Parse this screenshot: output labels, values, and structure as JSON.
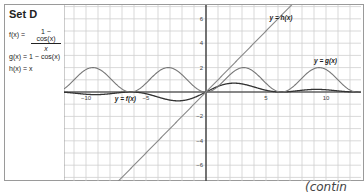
{
  "set_label": "Set D",
  "functions": {
    "f": {
      "lhs": "f(x) =",
      "numerator": "1 − cos(x)",
      "denominator": "x"
    },
    "g": {
      "text": "g(x) = 1 − cos(x)"
    },
    "h": {
      "text": "h(x) = x"
    }
  },
  "continued_label": "(contin",
  "chart_data": {
    "type": "line",
    "title": "Set D",
    "xlabel": "",
    "ylabel": "",
    "xlim": [
      -11.8,
      12.9
    ],
    "ylim": [
      -7.2,
      7.2
    ],
    "grid": true,
    "x_ticks": [
      -10,
      -5,
      5,
      10
    ],
    "y_ticks": [
      -6,
      -4,
      -2,
      2,
      4,
      6
    ],
    "x_tick_labels": [
      "−10",
      "−5",
      "5",
      "10"
    ],
    "y_tick_labels": [
      "−6",
      "−4",
      "−2",
      "2",
      "4",
      "6"
    ],
    "series": [
      {
        "name": "y = f(x)",
        "formula": "(1 - cos(x)) / x",
        "color": "#333333",
        "label_pos": [
          -7.6,
          -0.75
        ]
      },
      {
        "name": "y = g(x)",
        "formula": "1 - cos(x)",
        "color": "#777777",
        "label_pos": [
          9.0,
          2.4
        ]
      },
      {
        "name": "y = h(x)",
        "formula": "x",
        "color": "#888888",
        "label_pos": [
          5.3,
          5.9
        ]
      }
    ],
    "annotations": [
      "y = f(x)",
      "y = g(x)",
      "y = h(x)"
    ]
  }
}
